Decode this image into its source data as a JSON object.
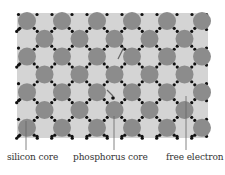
{
  "diagram": {
    "lattice": {
      "x": 17,
      "y": 13,
      "width": 191,
      "height": 125,
      "background": "#d4d4d4",
      "core_color": "#8c8c8c",
      "core_radius": 9,
      "electron_color": "#111111",
      "electron_radius": 1.6,
      "col_spacing": 35,
      "row_spacing": 17.8,
      "rows": 7,
      "first_center_x": 27,
      "first_center_y": 21
    },
    "phosphorus_core": {
      "cx": 114,
      "cy": 107
    },
    "free_electron": {
      "cx": 114,
      "cy": 55
    },
    "labels": {
      "silicon": "silicon core",
      "phosphorus": "phosphorus core",
      "free_electron": "free electron"
    },
    "callouts": [
      {
        "name": "silicon",
        "x": 26,
        "y1": 121,
        "y2": 150
      },
      {
        "name": "phosphorus",
        "x": 114,
        "y1": 116,
        "y2": 150
      },
      {
        "name": "free_electron",
        "x": 186,
        "y1": 96,
        "y2": 150
      }
    ]
  }
}
